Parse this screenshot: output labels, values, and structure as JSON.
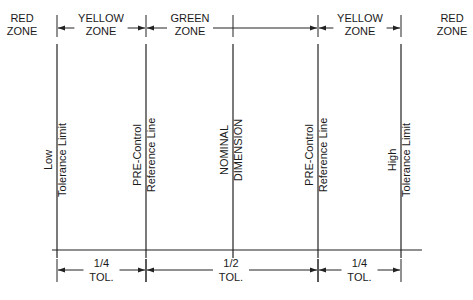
{
  "diagram": {
    "top_zones": [
      {
        "line1": "RED",
        "line2": "ZONE",
        "color_name": "red",
        "arrows": false
      },
      {
        "line1": "YELLOW",
        "line2": "ZONE",
        "color_name": "yellow",
        "arrows": true
      },
      {
        "line1": "GREEN",
        "line2": "ZONE",
        "color_name": "green",
        "arrows": true
      },
      {
        "line1": "YELLOW",
        "line2": "ZONE",
        "color_name": "yellow",
        "arrows": true
      },
      {
        "line1": "RED",
        "line2": "ZONE",
        "color_name": "red",
        "arrows": false
      }
    ],
    "vertical_lines": [
      {
        "line1": "Low",
        "line2": "Tolerance Limit"
      },
      {
        "line1": "PRE-Control",
        "line2": "Reference Line"
      },
      {
        "line1": "NOMINAL",
        "line2": "DIMENSION"
      },
      {
        "line1": "PRE-Control",
        "line2": "Reference Line"
      },
      {
        "line1": "High",
        "line2": "Tolerance Limit"
      }
    ],
    "bottom_dimensions": [
      {
        "line1": "1/4",
        "line2": "TOL."
      },
      {
        "line1": "1/2",
        "line2": "TOL."
      },
      {
        "line1": "1/4",
        "line2": "TOL."
      }
    ]
  }
}
